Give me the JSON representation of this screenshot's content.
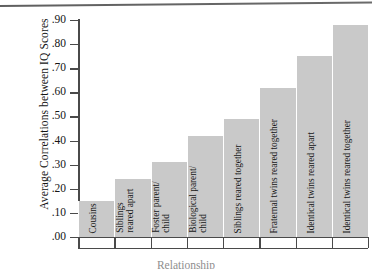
{
  "chart_data": {
    "type": "bar",
    "title": "",
    "xlabel": "Relationship",
    "ylabel": "Average Correlations between IQ Scores",
    "categories": [
      "Cousins",
      "Siblings reared apart",
      "Foster parent/ child",
      "Biological parent/ child",
      "Siblings reared together",
      "Fraternal twins reared together",
      "Identical twins reared apart",
      "Identical twins reared together"
    ],
    "values": [
      0.15,
      0.24,
      0.31,
      0.42,
      0.49,
      0.62,
      0.75,
      0.88
    ],
    "ylim": [
      0.0,
      0.9
    ],
    "ytick_labels": [
      ".90",
      ".80",
      ".70",
      ".60",
      ".50",
      ".40",
      ".30",
      ".20",
      ".10",
      ".00"
    ],
    "ytick_values": [
      0.9,
      0.8,
      0.7,
      0.6,
      0.5,
      0.4,
      0.3,
      0.2,
      0.1,
      0.0
    ],
    "grid": false,
    "legend": "none",
    "bar_color": "#c9c9c9",
    "axis_color": "#4a4a4a"
  },
  "axis": {
    "y_title": "Average Correlations between IQ Scores",
    "x_title": "Relationship"
  },
  "bars": [
    {
      "label_line1": "Cousins",
      "label_line2": ""
    },
    {
      "label_line1": "Siblings",
      "label_line2": "reared apart"
    },
    {
      "label_line1": "Foster parent/",
      "label_line2": "child"
    },
    {
      "label_line1": "Biological parent/",
      "label_line2": "child"
    },
    {
      "label_line1": "Siblings reared together",
      "label_line2": ""
    },
    {
      "label_line1": "Fraternal twins reared together",
      "label_line2": ""
    },
    {
      "label_line1": "Identical twins reared apart",
      "label_line2": ""
    },
    {
      "label_line1": "Identical twins reared together",
      "label_line2": ""
    }
  ]
}
